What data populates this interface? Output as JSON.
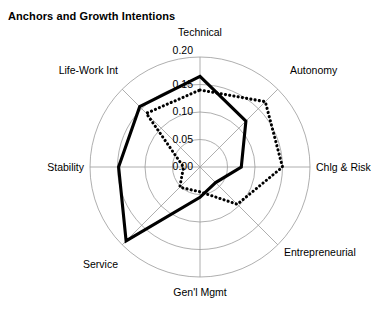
{
  "chart_data": {
    "type": "radar",
    "title": "Anchors and Growth Intentions",
    "categories": [
      "Technical",
      "Autonomy",
      "Chlg & Risk",
      "Entrepreneurial",
      "Gen'l Mgmt",
      "Service",
      "Stability",
      "Life-Work Int"
    ],
    "rlim": [
      0.0,
      0.2
    ],
    "rticks": [
      "0.00",
      "0.05",
      "0.10",
      "0.15",
      "0.20"
    ],
    "rtick_values": [
      0.0,
      0.05,
      0.1,
      0.15,
      0.2
    ],
    "grid": true,
    "legend": "none",
    "start_angle_deg": 90,
    "direction": "clockwise",
    "series": [
      {
        "name": "Solid",
        "style": "solid",
        "color": "#000000",
        "values": [
          0.165,
          0.118,
          0.075,
          0.04,
          0.055,
          0.19,
          0.148,
          0.155
        ]
      },
      {
        "name": "Dotted",
        "style": "dotted",
        "color": "#000000",
        "values": [
          0.14,
          0.168,
          0.15,
          0.096,
          0.045,
          0.052,
          0.03,
          0.138
        ]
      }
    ],
    "xlabel": "",
    "ylabel": ""
  },
  "labels": {
    "technical": "Technical",
    "autonomy": "Autonomy",
    "chlg_risk": "Chlg & Risk",
    "entrepreneurial": "Entrepreneurial",
    "genl_mgmt": "Gen'l Mgmt",
    "service": "Service",
    "stability": "Stability",
    "life_work": "Life-Work Int"
  },
  "ticks": {
    "t0": "0.00",
    "t1": "0.05",
    "t2": "0.10",
    "t3": "0.15",
    "t4": "0.20"
  }
}
